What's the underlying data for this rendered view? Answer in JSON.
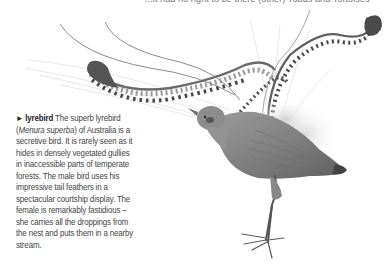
{
  "page": {
    "top_text_fragment": "...it had no right to be there (other) Toads and Tortoises",
    "caption": {
      "marker": "►",
      "term": "lyrebird",
      "part1": " The superb lyrebird (",
      "scientific_name": "Menura superba",
      "part2": ") of Australia is a secretive bird. It is rarely seen as it hides in densely vegetated gullies in inaccessible parts of temperate forests. The male bird uses his impressive tail feathers in a spectacular courtship display. The female is remarkably fastidious – she carries all the droppings from the nest and puts them in a nearby stream."
    },
    "illustration": {
      "subject": "lyrebird",
      "style": "grayscale pencil illustration",
      "ink_color": "#555555"
    }
  }
}
